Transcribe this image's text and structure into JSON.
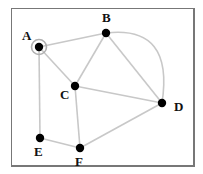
{
  "diagram": {
    "type": "graph",
    "nodes": [
      {
        "id": "A",
        "label": "A",
        "x": 39,
        "y": 47,
        "lx": 22,
        "ly": 40,
        "highlighted": true
      },
      {
        "id": "B",
        "label": "B",
        "x": 106,
        "y": 33,
        "lx": 102,
        "ly": 22
      },
      {
        "id": "C",
        "label": "C",
        "x": 75,
        "y": 86,
        "lx": 60,
        "ly": 99
      },
      {
        "id": "D",
        "label": "D",
        "x": 162,
        "y": 103,
        "lx": 174,
        "ly": 111
      },
      {
        "id": "E",
        "label": "E",
        "x": 40,
        "y": 138,
        "lx": 34,
        "ly": 156
      },
      {
        "id": "F",
        "label": "F",
        "x": 80,
        "y": 148,
        "lx": 75,
        "ly": 166
      }
    ],
    "edges": [
      {
        "from": "A",
        "to": "B"
      },
      {
        "from": "A",
        "to": "C"
      },
      {
        "from": "A",
        "to": "E"
      },
      {
        "from": "B",
        "to": "C"
      },
      {
        "from": "B",
        "to": "D"
      },
      {
        "from": "B",
        "to": "D",
        "curved": true
      },
      {
        "from": "C",
        "to": "D"
      },
      {
        "from": "C",
        "to": "F"
      },
      {
        "from": "E",
        "to": "F"
      },
      {
        "from": "F",
        "to": "D"
      }
    ],
    "colors": {
      "edge": "#c8c8c8",
      "node": "#000000",
      "frame": "#777777",
      "highlight_ring": "#b0b0b0"
    }
  }
}
